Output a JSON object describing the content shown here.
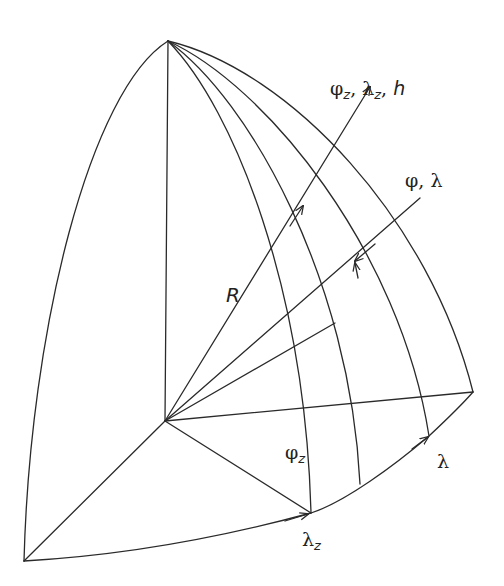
{
  "diagram": {
    "stroke_color": "#2a2a2a",
    "background": "#ffffff",
    "labels": {
      "geocentric_axis": {
        "parts": [
          "φ",
          "z",
          ", λ",
          "z",
          ", ",
          "h"
        ],
        "text": "φz, λz, h"
      },
      "geodetic_axis": {
        "text": "φ, λ"
      },
      "radius": {
        "text": "R"
      },
      "phi_z": {
        "base": "φ",
        "sub": "z"
      },
      "lambda": {
        "text": "λ"
      },
      "lambda_z": {
        "base": "λ",
        "sub": "z"
      }
    },
    "points": {
      "apex": [
        168,
        41
      ],
      "center": [
        165,
        421
      ],
      "left_corner": [
        24,
        561
      ],
      "right_corner": [
        473,
        392
      ],
      "phi_z_meridian_foot": [
        311,
        513
      ],
      "mid_meridian_foot": [
        360,
        484
      ],
      "lambda_meridian_foot": [
        429,
        436
      ]
    }
  }
}
